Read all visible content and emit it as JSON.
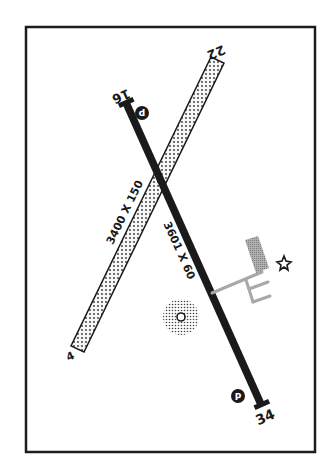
{
  "diagram": {
    "type": "airport-diagram",
    "colors": {
      "background": "#ffffff",
      "frame": "#1c1c1c",
      "runway_paved": "#1a1a1a",
      "runway_unpaved_fill": "#f2f2f2",
      "apron": "#9a9a9a",
      "taxiway": "#a8a8a8"
    },
    "runways": [
      {
        "id": "rwy-16-34",
        "ends": [
          "16",
          "34"
        ],
        "dimensions": "3601 X 60",
        "surface": "paved"
      },
      {
        "id": "rwy-4-22",
        "ends": [
          "4",
          "22"
        ],
        "dimensions": "3400 X 150",
        "surface": "turf"
      }
    ],
    "symbols": {
      "pattern_marker_north": "P",
      "pattern_marker_south": "P",
      "beacon": "rotating-beacon-star",
      "wind_indicator": "segmented-circle"
    }
  }
}
